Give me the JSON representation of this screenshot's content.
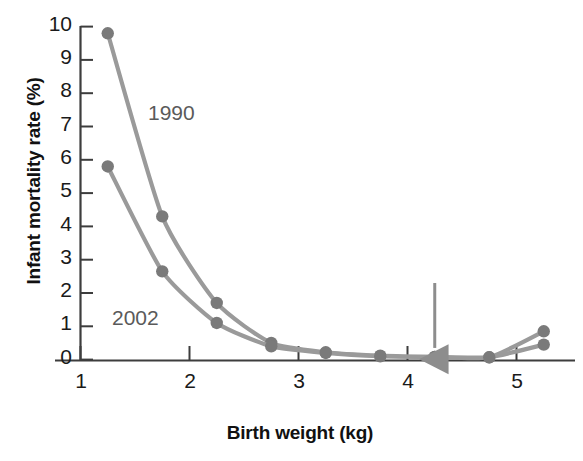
{
  "chart_data": {
    "type": "line",
    "title": "",
    "xlabel": "Birth weight (kg)",
    "ylabel": "Infant mortality rate (%)",
    "xlim": [
      1,
      5.5
    ],
    "ylim": [
      0,
      10
    ],
    "xticks": [
      "1",
      "2",
      "3",
      "4",
      "5"
    ],
    "xtick_values": [
      1,
      2,
      3,
      4,
      5
    ],
    "yticks": [
      "0",
      "1",
      "2",
      "3",
      "4",
      "5",
      "6",
      "7",
      "8",
      "9",
      "10"
    ],
    "ytick_values": [
      0,
      1,
      2,
      3,
      4,
      5,
      6,
      7,
      8,
      9,
      10
    ],
    "grid": false,
    "legend": "inline-annotations",
    "x": [
      1.25,
      1.75,
      2.25,
      2.75,
      3.25,
      3.75,
      4.25,
      4.75,
      5.25
    ],
    "series": [
      {
        "name": "1990",
        "color": "#9a9a9a",
        "values": [
          9.8,
          4.3,
          1.7,
          0.5,
          0.22,
          0.12,
          0.08,
          0.07,
          0.85
        ],
        "label_x": 2.0,
        "label_y": 7.35
      },
      {
        "name": "2002",
        "color": "#9a9a9a",
        "values": [
          5.8,
          2.65,
          1.1,
          0.4,
          0.2,
          0.1,
          0.08,
          0.07,
          0.45
        ],
        "label_x": 1.35,
        "label_y": 1.65
      }
    ],
    "annotations": [
      {
        "type": "arrow",
        "name": "lowest-mortality-arrow",
        "points_to_x": 4.25,
        "points_to_y": 0.08,
        "tail_y": 2.3,
        "color": "#8d8d8d"
      }
    ]
  },
  "labels": {
    "ylabel": "Infant mortality rate (%)",
    "xlabel": "Birth weight (kg)"
  },
  "colors": {
    "series": "#9a9a9a",
    "marker": "#7a7a7a",
    "axis": "#3d3d3d",
    "arrow": "#8d8d8d",
    "tick_text": "#1a1a1a",
    "annotation_text": "#5a5a5a"
  }
}
